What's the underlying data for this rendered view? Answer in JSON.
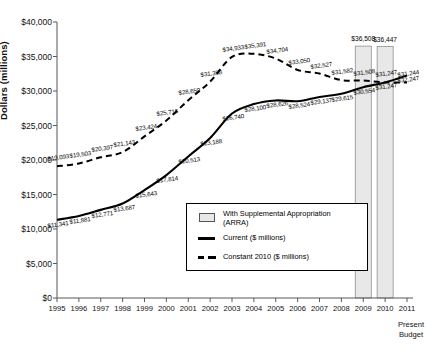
{
  "chart_data": {
    "type": "line",
    "title": "",
    "xlabel": "",
    "ylabel": "Dollars (millions)",
    "x": [
      "1995",
      "1996",
      "1997",
      "1998",
      "1999",
      "2000",
      "2001",
      "2002",
      "2003",
      "2004",
      "2005",
      "2006",
      "2007",
      "2008",
      "2009",
      "2010",
      "2011"
    ],
    "ylim": [
      0,
      40000
    ],
    "ytick_labels": [
      "$40,000",
      "$35,000",
      "$30,000",
      "$25,000",
      "$20,000",
      "$15,000",
      "$10,000",
      "$5,000",
      "$0"
    ],
    "ytick_values": [
      40000,
      35000,
      30000,
      25000,
      20000,
      15000,
      10000,
      5000,
      0
    ],
    "grid": false,
    "legend_position": "inside-lower-right",
    "x_axis_note": "Present Budget",
    "series": [
      {
        "name": "Current ($ millions)",
        "style": "solid",
        "values": [
          11341,
          11881,
          12771,
          13687,
          15643,
          17814,
          20513,
          23188,
          26740,
          28100,
          28626,
          28524,
          29137,
          29615,
          30554,
          31247,
          32247
        ],
        "labels": [
          "$11,341",
          "$11,881",
          "$12,771",
          "$13,687",
          "$15,643",
          "$17,814",
          "$20,513",
          "$23,188",
          "$26,740",
          "$28,100",
          "$28,626",
          "$28,524",
          "$29,137",
          "$29,615",
          "$30,554",
          "$31,247",
          "$32,247"
        ]
      },
      {
        "name": "Constant 2010 ($ millions)",
        "style": "dashed",
        "values": [
          19093,
          19503,
          20397,
          21143,
          23424,
          25716,
          28659,
          31358,
          34933,
          35391,
          34704,
          33050,
          32527,
          31582,
          31508,
          31247,
          31244
        ],
        "labels": [
          "$19,093",
          "$19,503",
          "$20,397",
          "$21,143",
          "$23,424",
          "$25,716",
          "$28,659",
          "$31,358",
          "$34,933",
          "$35,391",
          "$34,704",
          "$33,050",
          "$32,527",
          "$31,582",
          "$31,508",
          "$31,247",
          "$31,244"
        ]
      },
      {
        "name": "With Supplemental Appropriation (ARRA)",
        "style": "bar",
        "bar_years": [
          "2009",
          "2010"
        ],
        "bar_values": [
          36508,
          36447
        ],
        "bar_labels": [
          "$36,508",
          "$36,447"
        ]
      }
    ]
  },
  "legend": {
    "bar_label_line1": "With Supplemental Appropriation",
    "bar_label_line2": "(ARRA)",
    "current_label": "Current ($ millions)",
    "constant_label": "Constant 2010 ($ millions)"
  },
  "colors": {
    "series_line": "#000000",
    "bar_fill": "#e8e8e8",
    "bar_border": "#808080",
    "axis": "#595959",
    "text": "#111111"
  }
}
